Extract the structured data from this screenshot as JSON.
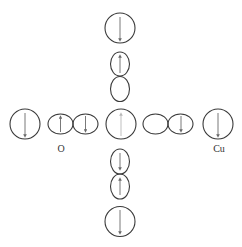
{
  "diagram": {
    "title": "",
    "colors": {
      "stroke": "#3a3a3a",
      "arrow": "#6a6a6a",
      "faint_arrow": "#b8b8b8",
      "background": "#ffffff"
    },
    "labels": {
      "oxygen": "O",
      "copper": "Cu"
    },
    "nodes": [
      {
        "id": "cu-top",
        "type": "Cu-circle",
        "spin": "down"
      },
      {
        "id": "o-top-upper-lobe",
        "type": "O-lobe",
        "spin": "up"
      },
      {
        "id": "o-top-lower-lobe",
        "type": "O-lobe",
        "spin": "none"
      },
      {
        "id": "cu-left",
        "type": "Cu-circle",
        "spin": "down"
      },
      {
        "id": "o-left-left-lobe",
        "type": "O-lobe",
        "spin": "up"
      },
      {
        "id": "o-left-right-lobe",
        "type": "O-lobe",
        "spin": "down"
      },
      {
        "id": "cu-center",
        "type": "Cu-circle",
        "spin": "up-faint"
      },
      {
        "id": "o-right-left-lobe",
        "type": "O-lobe",
        "spin": "none"
      },
      {
        "id": "o-right-right-lobe",
        "type": "O-lobe",
        "spin": "down"
      },
      {
        "id": "cu-right",
        "type": "Cu-circle",
        "spin": "down"
      },
      {
        "id": "o-bottom-upper-lobe",
        "type": "O-lobe",
        "spin": "down"
      },
      {
        "id": "o-bottom-lower-lobe",
        "type": "O-lobe",
        "spin": "up"
      },
      {
        "id": "cu-bottom",
        "type": "Cu-circle",
        "spin": "down"
      }
    ]
  }
}
